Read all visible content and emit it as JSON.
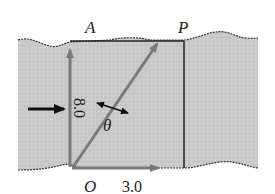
{
  "diagram": {
    "type": "river-crossing-vector-diagram",
    "labels": {
      "point_a": "A",
      "point_p": "P",
      "point_o": "O",
      "angle": "θ"
    },
    "vectors": {
      "boat_velocity": "8.0",
      "river_velocity": "3.0"
    },
    "colors": {
      "water": "#c8c8c8",
      "vector": "#7a7a7a",
      "line": "#222222",
      "bank": "#ffffff"
    }
  }
}
